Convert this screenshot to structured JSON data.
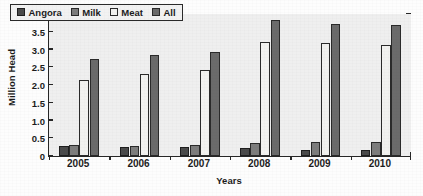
{
  "chart_data": {
    "type": "bar",
    "title": "",
    "subtitle": "",
    "xlabel": "Years",
    "ylabel": "Million Head",
    "categories": [
      "2005",
      "2006",
      "2007",
      "2008",
      "2009",
      "2010"
    ],
    "series": [
      {
        "name": "Angora",
        "color": "#4a4a4a",
        "border": "#1e1e1e",
        "values": [
          0.28,
          0.26,
          0.24,
          0.23,
          0.18,
          0.17
        ]
      },
      {
        "name": "Milk",
        "color": "#7d7d7d",
        "border": "#2a2a2a",
        "values": [
          0.3,
          0.29,
          0.31,
          0.38,
          0.4,
          0.39
        ]
      },
      {
        "name": "Meat",
        "color": "#f2f2f0",
        "border": "#2a2a2a",
        "values": [
          2.15,
          2.3,
          2.41,
          3.21,
          3.17,
          3.12
        ]
      },
      {
        "name": "All",
        "color": "#6b6b6b",
        "border": "#2a2a2a",
        "values": [
          2.73,
          2.85,
          2.93,
          3.82,
          3.72,
          3.68
        ]
      }
    ],
    "ylim": [
      0,
      4.0
    ],
    "ytick_values": [
      0,
      0.5,
      1.0,
      1.5,
      2.0,
      2.5,
      3.0,
      3.5,
      4.0
    ],
    "ytick_labels": [
      "0",
      "0.5",
      "1.0",
      "1.5",
      "2.0",
      "2.5",
      "3.0",
      "3.5",
      "4.0"
    ],
    "grid": false,
    "legend_position": "upper-left-inside",
    "plot_background": "#efefef",
    "axis_color": "#262626"
  },
  "legend": {
    "items": [
      {
        "label": "Angora"
      },
      {
        "label": "Milk"
      },
      {
        "label": "Meat"
      },
      {
        "label": "All"
      }
    ]
  }
}
